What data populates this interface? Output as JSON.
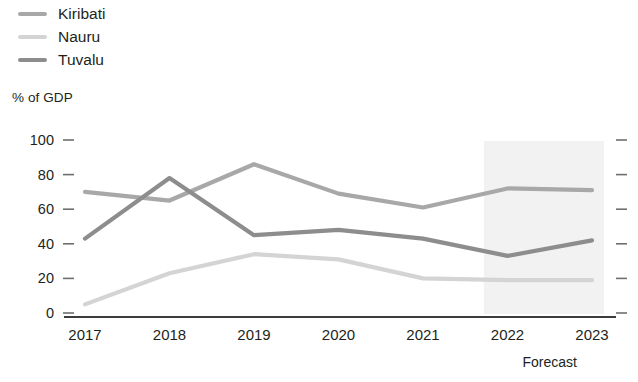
{
  "legend": {
    "items": [
      {
        "label": "Kiribati",
        "color": "#a8a8a8"
      },
      {
        "label": "Nauru",
        "color": "#d4d4d4"
      },
      {
        "label": "Tuvalu",
        "color": "#8d8d8d"
      }
    ]
  },
  "axis": {
    "y_title": "% of GDP",
    "y_ticks": [
      "100",
      "80",
      "60",
      "40",
      "20",
      "0"
    ],
    "x_ticks": [
      "2017",
      "2018",
      "2019",
      "2020",
      "2021",
      "2022",
      "2023"
    ]
  },
  "annotations": {
    "forecast": "Forecast"
  },
  "colors": {
    "kiribati": "#a8a8a8",
    "nauru": "#d4d4d4",
    "tuvalu": "#8d8d8d",
    "axis_line": "#3c3c3c",
    "tick": "#6e6e6e",
    "forecast_band": "#f2f2f2",
    "text": "#231f20"
  },
  "chart_data": {
    "type": "line",
    "title": "",
    "subtitle": "",
    "xlabel": "",
    "ylabel": "% of GDP",
    "categories": [
      "2017",
      "2018",
      "2019",
      "2020",
      "2021",
      "2022",
      "2023"
    ],
    "ylim": [
      0,
      100
    ],
    "yticks": [
      0,
      20,
      40,
      60,
      80,
      100
    ],
    "grid": false,
    "legend_position": "top-left",
    "annotations": [
      {
        "text": "Forecast",
        "from": "2022",
        "to": "2023",
        "type": "shaded-band"
      }
    ],
    "series": [
      {
        "name": "Kiribati",
        "color": "#a8a8a8",
        "values": [
          70,
          65,
          86,
          69,
          61,
          72,
          71
        ]
      },
      {
        "name": "Nauru",
        "color": "#d4d4d4",
        "values": [
          5,
          23,
          34,
          31,
          20,
          19,
          19
        ]
      },
      {
        "name": "Tuvalu",
        "color": "#8d8d8d",
        "values": [
          43,
          78,
          45,
          48,
          43,
          33,
          42
        ]
      }
    ]
  }
}
